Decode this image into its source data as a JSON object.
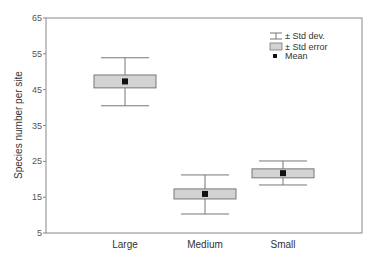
{
  "chart_data": {
    "type": "box",
    "title": "",
    "xlabel": "",
    "ylabel": "Species number per site",
    "ylim": [
      5,
      65
    ],
    "yticks": [
      5,
      15,
      25,
      35,
      45,
      55,
      65
    ],
    "grid": false,
    "categories": [
      "Large",
      "Medium",
      "Small"
    ],
    "series": [
      {
        "category": "Large",
        "mean": 47.3,
        "se_low": 45.5,
        "se_high": 49.1,
        "sd_low": 40.5,
        "sd_high": 53.9
      },
      {
        "category": "Medium",
        "mean": 15.9,
        "se_low": 14.5,
        "se_high": 17.3,
        "sd_low": 10.3,
        "sd_high": 21.2
      },
      {
        "category": "Small",
        "mean": 21.7,
        "se_low": 20.4,
        "se_high": 22.9,
        "sd_low": 18.4,
        "sd_high": 25.1
      }
    ],
    "legend": {
      "position": "top-right",
      "entries": [
        {
          "symbol": "whisker",
          "label": "± Std dev."
        },
        {
          "symbol": "box",
          "label": "± Std error"
        },
        {
          "symbol": "square",
          "label": "Mean"
        }
      ]
    },
    "colors": {
      "box_fill": "#d3d3d3",
      "stroke": "#777777",
      "mean_marker": "#111111"
    }
  }
}
